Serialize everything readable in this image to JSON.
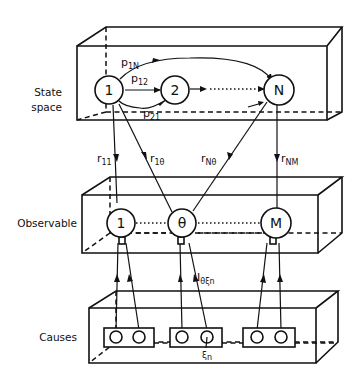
{
  "diagram": {
    "layers": {
      "state_space": {
        "label_line1": "State",
        "label_line2": "space"
      },
      "observable": {
        "label": "Observable"
      },
      "causes": {
        "label": "Causes"
      }
    },
    "state_nodes": [
      {
        "id": "1",
        "label": "1"
      },
      {
        "id": "2",
        "label": "2"
      },
      {
        "id": "N",
        "label": "N"
      }
    ],
    "observable_nodes": [
      {
        "id": "1",
        "label": "1"
      },
      {
        "id": "theta",
        "label": "θ"
      },
      {
        "id": "M",
        "label": "M"
      }
    ],
    "transition_labels": {
      "p1N": {
        "base": "p",
        "sub": "1N"
      },
      "p12": {
        "base": "p",
        "sub": "12"
      },
      "p21": {
        "base": "p",
        "sub": "21"
      }
    },
    "emission_labels": {
      "r11": {
        "base": "r",
        "sub": "11"
      },
      "r1theta": {
        "base": "r",
        "sub": "1θ"
      },
      "rNtheta": {
        "base": "r",
        "sub": "Nθ"
      },
      "rNM": {
        "base": "r",
        "sub": "NM"
      }
    },
    "cause_labels": {
      "influence": {
        "base": "I",
        "sub": "θξn"
      },
      "xi_n": {
        "base": "ξ",
        "sub": "n"
      }
    },
    "colors": {
      "ink": "#111111",
      "background": "#ffffff"
    }
  }
}
